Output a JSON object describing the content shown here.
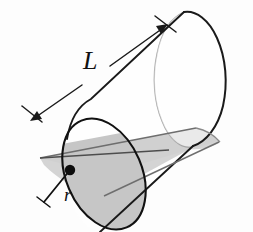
{
  "figure": {
    "type": "geometry-diagram",
    "background_color": "#fdfdfd",
    "labels": {
      "length_label": "L",
      "radius_label": "r"
    },
    "annotations": {
      "length_dimension_name": "length-dimension-arrow",
      "radius_dimension_name": "radius-line",
      "center_point_name": "cylinder-axis-center-point"
    },
    "colors": {
      "outline": "#1a1a1a",
      "hidden_edge": "#9a9a9a",
      "shade_plane_fill": "#c9c9c9",
      "shade_plane_fill_light": "#d8d8d8",
      "face_fill": "#ffffff",
      "disc_shade_fill": "#c4c4c4",
      "label_color": "#111111"
    },
    "geometry": {
      "near_ellipse_center": [
        104,
        174
      ],
      "near_ellipse_rx": 38,
      "near_ellipse_ry": 58,
      "near_ellipse_rotation_deg": -23,
      "far_ellipse_center": [
        196,
        88
      ],
      "far_ellipse_rx": 38,
      "far_ellipse_ry": 58,
      "far_ellipse_rotation_deg": -23,
      "axis_angle_deg": -43,
      "center_dot": [
        70,
        170
      ],
      "radius_end": [
        43,
        203
      ]
    }
  }
}
